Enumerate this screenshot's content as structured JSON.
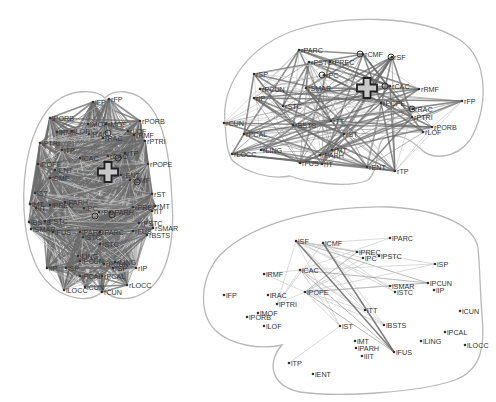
{
  "figure": {
    "panels": [
      {
        "id": "axial",
        "view": "top",
        "seed": {
          "x": 108,
          "y": 172
        },
        "hubs": [
          {
            "x": 118,
            "y": 158
          },
          {
            "x": 108,
            "y": 133
          },
          {
            "x": 137,
            "y": 182
          },
          {
            "x": 95,
            "y": 216
          },
          {
            "x": 112,
            "y": 215
          }
        ],
        "nodes": [
          {
            "label": "lFP",
            "x": 93,
            "y": 102
          },
          {
            "label": "rFP",
            "x": 109,
            "y": 99
          },
          {
            "label": "lPORB",
            "x": 50,
            "y": 118
          },
          {
            "label": "rPORB",
            "x": 140,
            "y": 121
          },
          {
            "label": "lRMF",
            "x": 57,
            "y": 132
          },
          {
            "label": "lLOF",
            "x": 72,
            "y": 131
          },
          {
            "label": "lMOF",
            "x": 88,
            "y": 124
          },
          {
            "label": "rMOF",
            "x": 106,
            "y": 124
          },
          {
            "label": "lRAC",
            "x": 89,
            "y": 134
          },
          {
            "label": "rRAC",
            "x": 103,
            "y": 138
          },
          {
            "label": "rLOF",
            "x": 128,
            "y": 131
          },
          {
            "label": "rRMF",
            "x": 134,
            "y": 135
          },
          {
            "label": "lPTRI",
            "x": 40,
            "y": 143
          },
          {
            "label": "rPTRI",
            "x": 145,
            "y": 141
          },
          {
            "label": "lTP",
            "x": 62,
            "y": 150
          },
          {
            "label": "lCAC",
            "x": 80,
            "y": 158
          },
          {
            "label": "rCAC",
            "x": 108,
            "y": 156
          },
          {
            "label": "rTP",
            "x": 125,
            "y": 153
          },
          {
            "label": "lPOPE",
            "x": 38,
            "y": 164
          },
          {
            "label": "rPOPE",
            "x": 148,
            "y": 164
          },
          {
            "label": "lENT",
            "x": 55,
            "y": 170
          },
          {
            "label": "rENT",
            "x": 121,
            "y": 175
          },
          {
            "label": "lCMF",
            "x": 50,
            "y": 178
          },
          {
            "label": "rCMF",
            "x": 130,
            "y": 180
          },
          {
            "label": "lST",
            "x": 35,
            "y": 193
          },
          {
            "label": "rST",
            "x": 152,
            "y": 194
          },
          {
            "label": "lMT",
            "x": 30,
            "y": 204
          },
          {
            "label": "lIT",
            "x": 36,
            "y": 208
          },
          {
            "label": "lPREC",
            "x": 50,
            "y": 205
          },
          {
            "label": "lPARH",
            "x": 65,
            "y": 202
          },
          {
            "label": "lPC",
            "x": 84,
            "y": 208
          },
          {
            "label": "rPC",
            "x": 99,
            "y": 212
          },
          {
            "label": "rPARH",
            "x": 110,
            "y": 212
          },
          {
            "label": "rPREC",
            "x": 133,
            "y": 207
          },
          {
            "label": "rMT",
            "x": 155,
            "y": 206
          },
          {
            "label": "rIT",
            "x": 152,
            "y": 211
          },
          {
            "label": "lBSTS",
            "x": 29,
            "y": 222
          },
          {
            "label": "lPSTC",
            "x": 45,
            "y": 221
          },
          {
            "label": "rPSTC",
            "x": 139,
            "y": 223
          },
          {
            "label": "lSMAR",
            "x": 31,
            "y": 229
          },
          {
            "label": "lFUS",
            "x": 53,
            "y": 232
          },
          {
            "label": "rFUS",
            "x": 133,
            "y": 231
          },
          {
            "label": "rSMAR",
            "x": 153,
            "y": 228
          },
          {
            "label": "rBSTS",
            "x": 147,
            "y": 235
          },
          {
            "label": "lPARC",
            "x": 80,
            "y": 232
          },
          {
            "label": "rPARC",
            "x": 100,
            "y": 232
          },
          {
            "label": "lSTC",
            "x": 83,
            "y": 237
          },
          {
            "label": "rSTC",
            "x": 100,
            "y": 244
          },
          {
            "label": "lLING",
            "x": 78,
            "y": 256
          },
          {
            "label": "lPCUN",
            "x": 80,
            "y": 261
          },
          {
            "label": "rPCUN",
            "x": 104,
            "y": 264
          },
          {
            "label": "rLING",
            "x": 115,
            "y": 262
          },
          {
            "label": "lIP",
            "x": 47,
            "y": 268
          },
          {
            "label": "lSP",
            "x": 66,
            "y": 268
          },
          {
            "label": "rSP",
            "x": 113,
            "y": 268
          },
          {
            "label": "rIP",
            "x": 136,
            "y": 268
          },
          {
            "label": "lPCAL",
            "x": 80,
            "y": 276
          },
          {
            "label": "rPCAL",
            "x": 102,
            "y": 276
          },
          {
            "label": "lLOCC",
            "x": 64,
            "y": 290
          },
          {
            "label": "lCUN",
            "x": 85,
            "y": 287
          },
          {
            "label": "rCUN",
            "x": 102,
            "y": 292
          },
          {
            "label": "rLOCC",
            "x": 127,
            "y": 285
          }
        ]
      },
      {
        "id": "right-lateral",
        "view": "right sagittal",
        "seed": {
          "x": 367,
          "y": 88
        },
        "hubs": [
          {
            "x": 360,
            "y": 54
          },
          {
            "x": 391,
            "y": 57
          },
          {
            "x": 322,
            "y": 75
          },
          {
            "x": 385,
            "y": 86
          },
          {
            "x": 412,
            "y": 109
          }
        ],
        "nodes": [
          {
            "label": "rPARC",
            "x": 299,
            "y": 50
          },
          {
            "label": "rCMF",
            "x": 363,
            "y": 54
          },
          {
            "label": "rSF",
            "x": 392,
            "y": 57
          },
          {
            "label": "rPSTC",
            "x": 309,
            "y": 62
          },
          {
            "label": "rPREC",
            "x": 330,
            "y": 62
          },
          {
            "label": "rSP",
            "x": 254,
            "y": 74
          },
          {
            "label": "rPC",
            "x": 324,
            "y": 75
          },
          {
            "label": "rPCUN",
            "x": 260,
            "y": 89
          },
          {
            "label": "rSMAR",
            "x": 306,
            "y": 88
          },
          {
            "label": "rCAC",
            "x": 390,
            "y": 86
          },
          {
            "label": "rRMF",
            "x": 419,
            "y": 89
          },
          {
            "label": "rIP",
            "x": 254,
            "y": 98
          },
          {
            "label": "rFP",
            "x": 462,
            "y": 101
          },
          {
            "label": "rPOPE",
            "x": 381,
            "y": 103
          },
          {
            "label": "rSTC",
            "x": 283,
            "y": 106
          },
          {
            "label": "rRAC",
            "x": 413,
            "y": 109
          },
          {
            "label": "rPTRI",
            "x": 412,
            "y": 117
          },
          {
            "label": "rCUN",
            "x": 224,
            "y": 123
          },
          {
            "label": "rTT",
            "x": 331,
            "y": 121
          },
          {
            "label": "rBSTS",
            "x": 293,
            "y": 125
          },
          {
            "label": "rPORB",
            "x": 432,
            "y": 127
          },
          {
            "label": "rLOF",
            "x": 423,
            "y": 132
          },
          {
            "label": "rPCAL",
            "x": 244,
            "y": 134
          },
          {
            "label": "rST",
            "x": 344,
            "y": 134
          },
          {
            "label": "rLOCC",
            "x": 232,
            "y": 154
          },
          {
            "label": "rLING",
            "x": 261,
            "y": 150
          },
          {
            "label": "rMT",
            "x": 332,
            "y": 150
          },
          {
            "label": "rPARH",
            "x": 320,
            "y": 155
          },
          {
            "label": "rFUS",
            "x": 300,
            "y": 163
          },
          {
            "label": "rIT",
            "x": 322,
            "y": 164
          },
          {
            "label": "rENT",
            "x": 367,
            "y": 167
          },
          {
            "label": "rTP",
            "x": 395,
            "y": 171
          }
        ]
      },
      {
        "id": "left-lateral",
        "view": "left sagittal",
        "hubs": [],
        "nodes": [
          {
            "label": "lSF",
            "x": 296,
            "y": 241
          },
          {
            "label": "lCMF",
            "x": 323,
            "y": 243
          },
          {
            "label": "lPARC",
            "x": 390,
            "y": 238
          },
          {
            "label": "lPREC",
            "x": 357,
            "y": 252
          },
          {
            "label": "lPSTC",
            "x": 379,
            "y": 256
          },
          {
            "label": "lPC",
            "x": 363,
            "y": 258
          },
          {
            "label": "lSP",
            "x": 435,
            "y": 264
          },
          {
            "label": "lRMF",
            "x": 264,
            "y": 274
          },
          {
            "label": "lCAC",
            "x": 300,
            "y": 270
          },
          {
            "label": "lPCUN",
            "x": 428,
            "y": 283
          },
          {
            "label": "lIP",
            "x": 434,
            "y": 290
          },
          {
            "label": "lSMAR",
            "x": 390,
            "y": 286
          },
          {
            "label": "lSTC",
            "x": 395,
            "y": 292
          },
          {
            "label": "lFP",
            "x": 224,
            "y": 295
          },
          {
            "label": "lRAC",
            "x": 268,
            "y": 295
          },
          {
            "label": "lPOPE",
            "x": 305,
            "y": 292
          },
          {
            "label": "lPTRI",
            "x": 277,
            "y": 304
          },
          {
            "label": "lMOF",
            "x": 258,
            "y": 313
          },
          {
            "label": "lPORB",
            "x": 247,
            "y": 317
          },
          {
            "label": "lLOF",
            "x": 264,
            "y": 326
          },
          {
            "label": "lTT",
            "x": 365,
            "y": 310
          },
          {
            "label": "lCUN",
            "x": 460,
            "y": 311
          },
          {
            "label": "lST",
            "x": 340,
            "y": 326
          },
          {
            "label": "lBSTS",
            "x": 384,
            "y": 325
          },
          {
            "label": "lPCAL",
            "x": 445,
            "y": 332
          },
          {
            "label": "lLING",
            "x": 421,
            "y": 341
          },
          {
            "label": "lLOCC",
            "x": 465,
            "y": 345
          },
          {
            "label": "lMT",
            "x": 355,
            "y": 341
          },
          {
            "label": "lPARH",
            "x": 356,
            "y": 348
          },
          {
            "label": "lFUS",
            "x": 394,
            "y": 352
          },
          {
            "label": "lIIT",
            "x": 362,
            "y": 356
          },
          {
            "label": "lTP",
            "x": 289,
            "y": 363
          },
          {
            "label": "lENT",
            "x": 313,
            "y": 374
          }
        ]
      }
    ]
  },
  "colors": {
    "outline": "#b8b8b8",
    "edge_dark": "#6a6a6a",
    "edge_light": "#c8c8c8",
    "node": "#333333",
    "seed_fill": "#c8c8c8"
  }
}
